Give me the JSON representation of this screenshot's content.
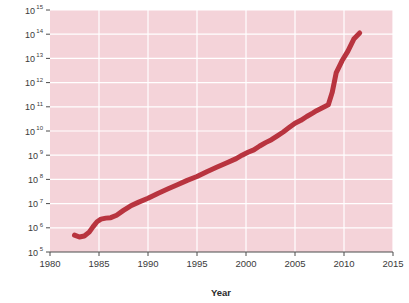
{
  "chart_data": {
    "type": "line",
    "title": "",
    "xlabel": "Year",
    "ylabel": "",
    "yscale": "log",
    "xlim": [
      1980,
      2015
    ],
    "ylim": [
      100000,
      1000000000000000
    ],
    "grid": true,
    "legend": "none",
    "plot_background_color": "#f4d3d9",
    "grid_color": "#ffffff",
    "line_color": "#b8343f",
    "line_width_px": 5,
    "axis_color": "#4d4d4d",
    "x_ticks": [
      1980,
      1985,
      1990,
      1995,
      2000,
      2005,
      2010,
      2015
    ],
    "x_tick_labels": [
      "1980",
      "1985",
      "1990",
      "1995",
      "2000",
      "2005",
      "2010",
      "2015"
    ],
    "y_ticks": [
      5,
      6,
      7,
      8,
      9,
      10,
      11,
      12,
      13,
      14,
      15
    ],
    "y_tick_labels": [
      {
        "base": "10",
        "exp": "5"
      },
      {
        "base": "10",
        "exp": "6"
      },
      {
        "base": "10",
        "exp": "7"
      },
      {
        "base": "10",
        "exp": "8"
      },
      {
        "base": "10",
        "exp": "9"
      },
      {
        "base": "10",
        "exp": "10"
      },
      {
        "base": "10",
        "exp": "11"
      },
      {
        "base": "10",
        "exp": "12"
      },
      {
        "base": "10",
        "exp": "13"
      },
      {
        "base": "10",
        "exp": "14"
      },
      {
        "base": "10",
        "exp": "15"
      }
    ],
    "series": [
      {
        "name": "value",
        "x": [
          1982.5,
          1983.0,
          1983.5,
          1984.0,
          1984.4,
          1984.8,
          1985.2,
          1985.7,
          1986.2,
          1986.8,
          1987.5,
          1988.2,
          1989.0,
          1990.0,
          1991.0,
          1992.0,
          1993.0,
          1994.0,
          1995.0,
          1996.0,
          1997.0,
          1998.0,
          1999.0,
          1999.6,
          2000.2,
          2000.8,
          2001.4,
          2002.0,
          2002.6,
          2003.2,
          2003.8,
          2004.4,
          2005.0,
          2005.6,
          2006.2,
          2006.8,
          2007.2,
          2007.6,
          2008.0,
          2008.4,
          2008.8,
          2009.2,
          2009.8,
          2010.4,
          2011.0,
          2011.6
        ],
        "y_log10": [
          5.7,
          5.62,
          5.66,
          5.82,
          6.05,
          6.25,
          6.36,
          6.4,
          6.42,
          6.52,
          6.72,
          6.9,
          7.05,
          7.22,
          7.42,
          7.6,
          7.78,
          7.96,
          8.12,
          8.32,
          8.5,
          8.68,
          8.86,
          9.0,
          9.12,
          9.22,
          9.38,
          9.52,
          9.64,
          9.8,
          9.96,
          10.14,
          10.32,
          10.44,
          10.6,
          10.74,
          10.84,
          10.92,
          11.0,
          11.08,
          11.6,
          12.4,
          12.9,
          13.3,
          13.8,
          14.05
        ]
      }
    ]
  }
}
